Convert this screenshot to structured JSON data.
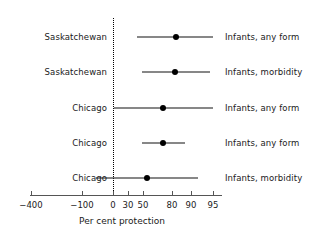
{
  "chart_data": {
    "type": "scatter",
    "subtype": "forest-plot",
    "title": "",
    "xlabel": "Per cent protection",
    "ylabel": "",
    "grid": false,
    "legend": "none",
    "axis_scale": "non-linear (per-cent protection / odds scale)",
    "xticks": [
      {
        "label": "−400",
        "value": -400,
        "px": 31
      },
      {
        "label": "−100",
        "value": -100,
        "px": 82
      },
      {
        "label": "0",
        "value": 0,
        "px": 113
      },
      {
        "label": "30",
        "value": 30,
        "px": 128
      },
      {
        "label": "50",
        "value": 50,
        "px": 143
      },
      {
        "label": "80",
        "value": 80,
        "px": 172
      },
      {
        "label": "90",
        "value": 90,
        "px": 191
      },
      {
        "label": "95",
        "value": 95,
        "px": 213
      }
    ],
    "reference_line": {
      "value": 0,
      "style": "dotted"
    },
    "rows": [
      {
        "study": "Saskatchewan",
        "outcome": "Infants, any form",
        "estimate": 80,
        "ci_low": 43,
        "ci_high": 95,
        "y_px": 37,
        "px_low": 137,
        "px_high": 213,
        "px_point": 176
      },
      {
        "study": "Saskatchewan",
        "outcome": "Infants, morbidity",
        "estimate": 80,
        "ci_low": 50,
        "ci_high": 93,
        "y_px": 72,
        "px_low": 142,
        "px_high": 210,
        "px_point": 175
      },
      {
        "study": "Chicago",
        "outcome": "Infants, any form",
        "estimate": 72,
        "ci_low": 0,
        "ci_high": 95,
        "y_px": 108,
        "px_low": 114,
        "px_high": 213,
        "px_point": 163
      },
      {
        "study": "Chicago",
        "outcome": "Infants, any form",
        "estimate": 72,
        "ci_low": 50,
        "ci_high": 86,
        "y_px": 143,
        "px_low": 142,
        "px_high": 185,
        "px_point": 163
      },
      {
        "study": "Chicago",
        "outcome": "Infants, morbidity",
        "estimate": 59,
        "ci_low": -60,
        "ci_high": 89,
        "y_px": 178,
        "px_low": 96,
        "px_high": 198,
        "px_point": 147
      }
    ]
  },
  "axis": {
    "line_y_px": 195,
    "line_left_px": 30,
    "line_right_px": 222,
    "tick_label_y_px": 200,
    "title_y_px": 216,
    "title_center_px": 122
  }
}
